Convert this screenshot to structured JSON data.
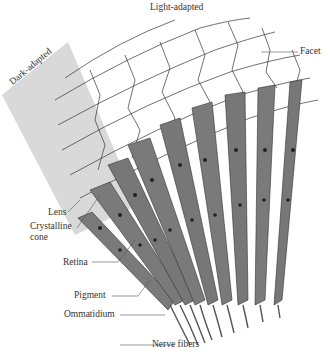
{
  "diagram": {
    "labels": {
      "light_adapted": "Light-adapted",
      "dark_adapted": "Dark-adapted",
      "facet": "Facet",
      "lens": "Lens",
      "crystalline_cone_line1": "Crystalline",
      "crystalline_cone_line2": "cone",
      "retina": "Retina",
      "pigment": "Pigment",
      "ommatidium": "Ommatidium",
      "nerve_fibers": "Nerve fibers"
    },
    "colors": {
      "background": "#ffffff",
      "dark_adapted_region": "#d9d9d9",
      "ommatidium_fill": "#7a7a7a",
      "ommatidium_dark": "#4a4a4a",
      "facet_lines": "#333333",
      "label_text": "#333333"
    },
    "ommatidia_count": 10
  }
}
